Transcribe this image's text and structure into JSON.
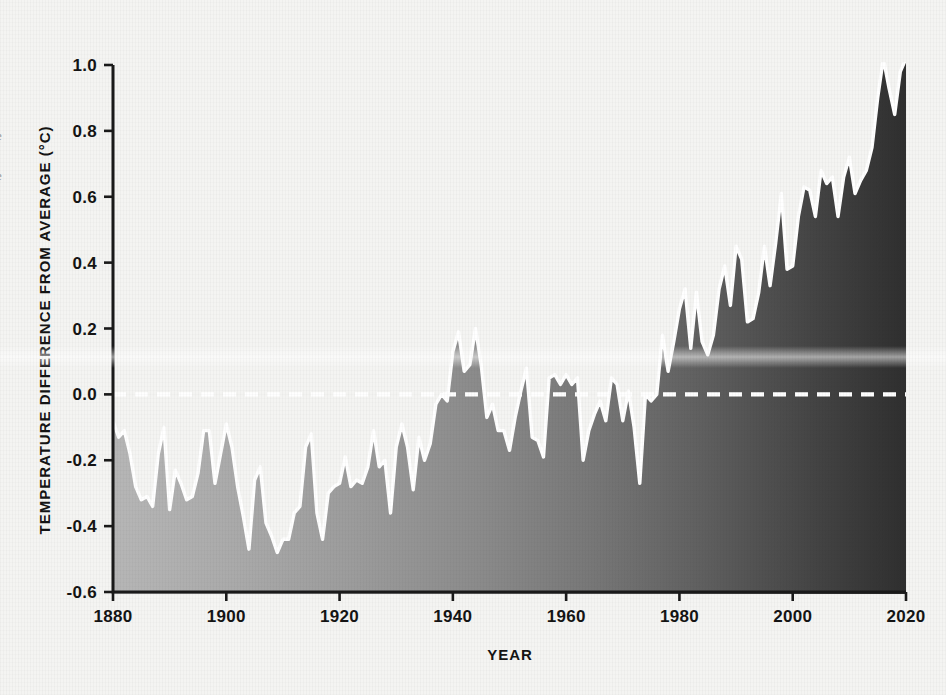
{
  "figure": {
    "background_color": "#f4f4f2",
    "plot_area": {
      "left": 113,
      "top": 65,
      "right": 906,
      "bottom": 592
    }
  },
  "edge_text": {
    "fragment_upper": "e",
    "fragment_lower": "e"
  },
  "chart_data": {
    "type": "area",
    "title": "",
    "subtitle": "",
    "xlabel": "YEAR",
    "ylabel": "TEMPERATURE DIFFERENCE FROM AVERAGE (°C)",
    "xlim": [
      1880,
      2020
    ],
    "ylim": [
      -0.6,
      1.0
    ],
    "xticks": [
      1880,
      1900,
      1920,
      1940,
      1960,
      1980,
      2000,
      2020
    ],
    "xtick_labels": [
      "1880",
      "1900",
      "1920",
      "1940",
      "1960",
      "1980",
      "2000",
      "2020"
    ],
    "yticks": [
      -0.6,
      -0.4,
      -0.2,
      0.0,
      0.2,
      0.4,
      0.6,
      0.8,
      1.0
    ],
    "ytick_labels": [
      "-0.6",
      "-0.4",
      "-0.2",
      "0.0",
      "0.2",
      "0.4",
      "0.6",
      "0.8",
      "1.0"
    ],
    "grid": false,
    "legend": null,
    "reference_line": {
      "value": 0.0,
      "style": "dashed",
      "color": "#ffffff",
      "label": ""
    },
    "fill_gradient": {
      "from": "#b4b4b4",
      "to": "#323232",
      "direction": "left-to-right"
    },
    "outline_color": "#ffffff",
    "series": [
      {
        "name": "Global temperature anomaly",
        "x": [
          1880,
          1881,
          1882,
          1883,
          1884,
          1885,
          1886,
          1887,
          1888,
          1889,
          1890,
          1891,
          1892,
          1893,
          1894,
          1895,
          1896,
          1897,
          1898,
          1899,
          1900,
          1901,
          1902,
          1903,
          1904,
          1905,
          1906,
          1907,
          1908,
          1909,
          1910,
          1911,
          1912,
          1913,
          1914,
          1915,
          1916,
          1917,
          1918,
          1919,
          1920,
          1921,
          1922,
          1923,
          1924,
          1925,
          1926,
          1927,
          1928,
          1929,
          1930,
          1931,
          1932,
          1933,
          1934,
          1935,
          1936,
          1937,
          1938,
          1939,
          1940,
          1941,
          1942,
          1943,
          1944,
          1945,
          1946,
          1947,
          1948,
          1949,
          1950,
          1951,
          1952,
          1953,
          1954,
          1955,
          1956,
          1957,
          1958,
          1959,
          1960,
          1961,
          1962,
          1963,
          1964,
          1965,
          1966,
          1967,
          1968,
          1969,
          1970,
          1971,
          1972,
          1973,
          1974,
          1975,
          1976,
          1977,
          1978,
          1979,
          1980,
          1981,
          1982,
          1983,
          1984,
          1985,
          1986,
          1987,
          1988,
          1989,
          1990,
          1991,
          1992,
          1993,
          1994,
          1995,
          1996,
          1997,
          1998,
          1999,
          2000,
          2001,
          2002,
          2003,
          2004,
          2005,
          2006,
          2007,
          2008,
          2009,
          2010,
          2011,
          2012,
          2013,
          2014,
          2015,
          2016,
          2017,
          2018,
          2019,
          2020
        ],
        "values": [
          -0.08,
          -0.13,
          -0.11,
          -0.18,
          -0.28,
          -0.32,
          -0.31,
          -0.34,
          -0.18,
          -0.1,
          -0.35,
          -0.23,
          -0.27,
          -0.32,
          -0.31,
          -0.24,
          -0.11,
          -0.11,
          -0.27,
          -0.18,
          -0.09,
          -0.16,
          -0.28,
          -0.37,
          -0.47,
          -0.26,
          -0.22,
          -0.39,
          -0.43,
          -0.48,
          -0.44,
          -0.44,
          -0.36,
          -0.34,
          -0.16,
          -0.12,
          -0.36,
          -0.44,
          -0.3,
          -0.28,
          -0.27,
          -0.19,
          -0.28,
          -0.26,
          -0.27,
          -0.22,
          -0.11,
          -0.22,
          -0.2,
          -0.36,
          -0.16,
          -0.09,
          -0.16,
          -0.29,
          -0.13,
          -0.2,
          -0.15,
          -0.03,
          0.0,
          -0.02,
          0.13,
          0.19,
          0.07,
          0.09,
          0.2,
          0.09,
          -0.07,
          -0.03,
          -0.11,
          -0.11,
          -0.17,
          -0.07,
          0.01,
          0.08,
          -0.13,
          -0.14,
          -0.19,
          0.05,
          0.06,
          0.03,
          0.06,
          0.03,
          0.05,
          -0.2,
          -0.11,
          -0.06,
          -0.02,
          -0.08,
          0.05,
          0.03,
          -0.08,
          0.01,
          -0.1,
          -0.27,
          0.0,
          -0.02,
          -0.0,
          0.18,
          0.07,
          0.16,
          0.26,
          0.32,
          0.14,
          0.31,
          0.16,
          0.12,
          0.18,
          0.32,
          0.39,
          0.27,
          0.45,
          0.41,
          0.22,
          0.23,
          0.31,
          0.45,
          0.33,
          0.46,
          0.61,
          0.38,
          0.39,
          0.54,
          0.63,
          0.62,
          0.54,
          0.68,
          0.64,
          0.66,
          0.54,
          0.66,
          0.72,
          0.61,
          0.65,
          0.68,
          0.75,
          0.9,
          1.02,
          0.93,
          0.85,
          0.98,
          1.02
        ]
      }
    ]
  }
}
